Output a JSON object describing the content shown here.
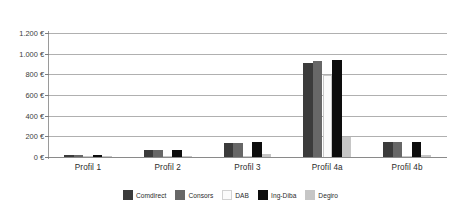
{
  "chart_data": {
    "type": "bar",
    "title": "",
    "subtitle": "",
    "xlabel": "",
    "ylabel": "",
    "categories": [
      "Profil 1",
      "Profil 2",
      "Profil 3",
      "Profil 4a",
      "Profil 4b"
    ],
    "ylim": [
      0,
      1200
    ],
    "ytick_values": [
      0,
      200,
      400,
      600,
      800,
      1000,
      1200
    ],
    "ytick_labels": [
      "0 €",
      "200 €",
      "400 €",
      "600 €",
      "800 €",
      "1.000 €",
      "1.200 €"
    ],
    "grid": true,
    "legend_position": "bottom",
    "currency_symbol": "€",
    "series": [
      {
        "name": "Comdirect",
        "color": "#3b3b3b",
        "values": [
          16,
          68,
          140,
          910,
          148
        ]
      },
      {
        "name": "Consors",
        "color": "#676767",
        "values": [
          16,
          66,
          139,
          930,
          148
        ]
      },
      {
        "name": "DAB",
        "color": "#fbfbfb",
        "values": [
          3,
          3,
          3,
          790,
          3
        ]
      },
      {
        "name": "Ing-Diba",
        "color": "#0d0d0d",
        "values": [
          18,
          65,
          142,
          935,
          149
        ]
      },
      {
        "name": "Degiro",
        "color": "#c6c6c6",
        "values": [
          4,
          12,
          26,
          198,
          24
        ]
      }
    ]
  },
  "legend": {
    "items": [
      {
        "label": "Comdirect",
        "color": "#3b3b3b"
      },
      {
        "label": "Consors",
        "color": "#676767"
      },
      {
        "label": "DAB",
        "color": "#fbfbfb"
      },
      {
        "label": "Ing-Diba",
        "color": "#0d0d0d"
      },
      {
        "label": "Degiro",
        "color": "#c6c6c6"
      }
    ]
  },
  "axis": {
    "gridline_color": "#b0b0b0",
    "axis_color": "#9a9a9a",
    "tick_text_color": "#3c3c3c"
  },
  "background": "#ffffff"
}
